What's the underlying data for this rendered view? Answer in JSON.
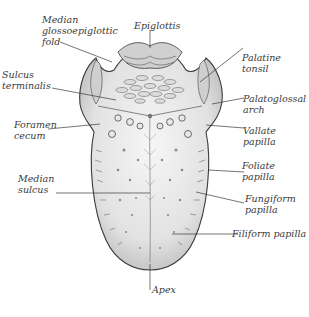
{
  "figure": {
    "labels": {
      "median_glossoepiglottic_fold": "Median\nglossoepiglottic\nfold",
      "epiglottis": "Epiglottis",
      "palatine_tonsil": "Palatine\ntonsil",
      "sulcus_terminalis": "Sulcus\nterminalis",
      "palatoglossal_arch": "Palatoglossal\narch",
      "foramen_cecum": "Foramen\ncecum",
      "vallate_papilla": "Vallate\npapilla",
      "median_sulcus": "Median\nsulcus",
      "foliate_papilla": "Foliate\npapilla",
      "fungiform_papilla": "Fungiform\npapilla",
      "filiform_papilla": "Filiform papilla",
      "apex": "Apex"
    },
    "colors": {
      "ink": "#3a3a3a",
      "tongue_fill": "#ececec",
      "shade": "#bdbdbd",
      "background": "#ffffff"
    }
  }
}
